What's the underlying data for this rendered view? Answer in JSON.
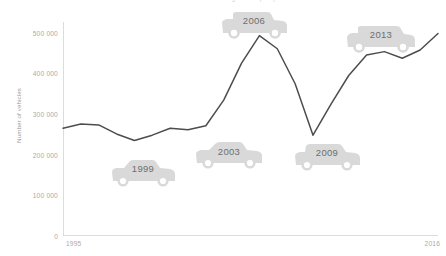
{
  "title": "Number of vehicles registered per year",
  "chart_data": {
    "type": "line",
    "title": "Number of vehicles registered per year",
    "xlabel": "",
    "ylabel": "Number of vehicles",
    "xlim": [
      1995,
      2016
    ],
    "ylim": [
      0,
      520000
    ],
    "grid": false,
    "legend": "none",
    "x_tick_labels": [
      "1995",
      "2016"
    ],
    "y_tick_labels": [
      "0",
      "100 000",
      "200 000",
      "300 000",
      "400 000",
      "500 000"
    ],
    "y_tick_values": [
      0,
      100000,
      200000,
      300000,
      400000,
      500000
    ],
    "line_color": "#4d4d4d",
    "series": [
      {
        "name": "Number of vehicles",
        "x": [
          1995,
          1996,
          1997,
          1998,
          1999,
          2000,
          2001,
          2002,
          2003,
          2004,
          2005,
          2006,
          2007,
          2008,
          2009,
          2010,
          2011,
          2012,
          2013,
          2014,
          2015,
          2016
        ],
        "values": [
          262000,
          272000,
          270000,
          248000,
          232000,
          245000,
          262000,
          258000,
          268000,
          330000,
          420000,
          487000,
          455000,
          370000,
          245000,
          320000,
          390000,
          440000,
          448000,
          432000,
          452000,
          492000
        ]
      }
    ],
    "annotations": [
      {
        "label": "1999",
        "year": 1999,
        "type": "car-marker"
      },
      {
        "label": "2003",
        "year": 2003,
        "type": "car-marker"
      },
      {
        "label": "2006",
        "year": 2006,
        "type": "car-marker"
      },
      {
        "label": "2009",
        "year": 2009,
        "type": "car-marker"
      },
      {
        "label": "2013",
        "year": 2013,
        "type": "car-marker"
      }
    ]
  },
  "axis": {
    "y_title": "Number of vehicles",
    "y_ticks": [
      "500 000",
      "400 000",
      "300 000",
      "200 000",
      "100 000",
      "0"
    ],
    "x_start": "1995",
    "x_end": "2016"
  },
  "markers": {
    "m1": "1999",
    "m2": "2003",
    "m3": "2006",
    "m4": "2009",
    "m5": "2013"
  },
  "colors": {
    "line": "#4d4d4d",
    "axis": "#dcdcdc",
    "tick_text": "#aaaaaa",
    "marker_fill": "#d9d9d9",
    "marker_text": "#6e6e6e"
  }
}
